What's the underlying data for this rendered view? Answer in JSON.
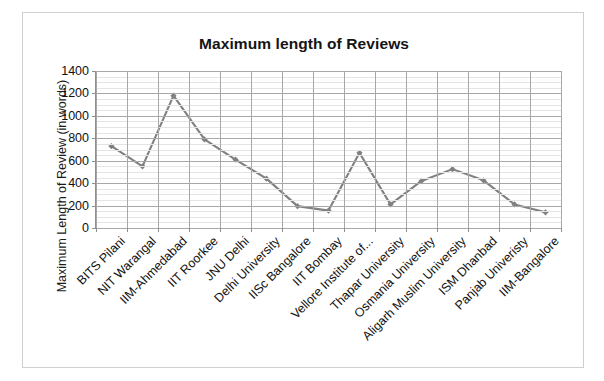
{
  "chart_data": {
    "type": "line",
    "title": "Maximum length of Reviews",
    "xlabel": "",
    "ylabel": "Maximum Length of Review (in words)",
    "ylim": [
      0,
      1400
    ],
    "ytick_step": 200,
    "yticks": [
      "1400",
      "1200",
      "1000",
      "800",
      "600",
      "400",
      "200",
      "0"
    ],
    "grid": true,
    "legend": "none",
    "series_color": "#808080",
    "categories": [
      "BITS Pilani",
      "NIT Warangal",
      "IIM-Ahmedabad",
      "IIT Roorkee",
      "JNU Delhi",
      "Delhi University",
      "IISc Bangalore",
      "IIT Bombay",
      "Vellore Institute of...",
      "Thapar University",
      "Osmania University",
      "Aligarh Muslim University",
      "ISM Dhanbad",
      "Panjab Univeristy",
      "IIM-Bangalore"
    ],
    "values": [
      730,
      550,
      1180,
      790,
      610,
      440,
      195,
      155,
      670,
      210,
      420,
      525,
      425,
      210,
      140
    ]
  }
}
